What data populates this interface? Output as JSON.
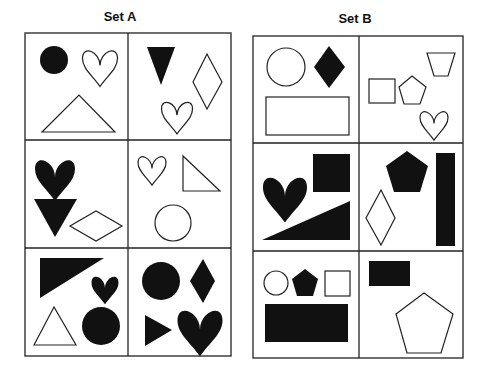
{
  "sets": [
    {
      "title": "Set A",
      "cells": [
        {
          "row": 1,
          "col": 1,
          "shapes": [
            "black circle",
            "white heart",
            "white triangle"
          ]
        },
        {
          "row": 1,
          "col": 2,
          "shapes": [
            "black inverted triangle",
            "white diamond",
            "white heart"
          ]
        },
        {
          "row": 2,
          "col": 1,
          "shapes": [
            "black heart",
            "black inverted triangle",
            "white diamond"
          ]
        },
        {
          "row": 2,
          "col": 2,
          "shapes": [
            "white heart",
            "white right triangle",
            "white circle"
          ]
        },
        {
          "row": 3,
          "col": 1,
          "shapes": [
            "black right triangle",
            "black heart",
            "white triangle",
            "black circle"
          ]
        },
        {
          "row": 3,
          "col": 2,
          "shapes": [
            "black circle",
            "black diamond",
            "black triangle",
            "black heart"
          ]
        }
      ]
    },
    {
      "title": "Set B",
      "cells": [
        {
          "row": 1,
          "col": 1,
          "shapes": [
            "white circle",
            "black diamond",
            "white rectangle"
          ]
        },
        {
          "row": 1,
          "col": 2,
          "shapes": [
            "white trapezoid",
            "white square",
            "white pentagon",
            "white heart"
          ]
        },
        {
          "row": 2,
          "col": 1,
          "shapes": [
            "black square",
            "black heart",
            "black right triangle"
          ]
        },
        {
          "row": 2,
          "col": 2,
          "shapes": [
            "black pentagon",
            "black bar",
            "white diamond"
          ]
        },
        {
          "row": 3,
          "col": 1,
          "shapes": [
            "white circle",
            "black pentagon",
            "white square",
            "black rectangle"
          ]
        },
        {
          "row": 3,
          "col": 2,
          "shapes": [
            "black rectangle",
            "white pentagon"
          ]
        }
      ]
    }
  ],
  "colors": {
    "ink": "#111111",
    "paper": "#ffffff"
  }
}
